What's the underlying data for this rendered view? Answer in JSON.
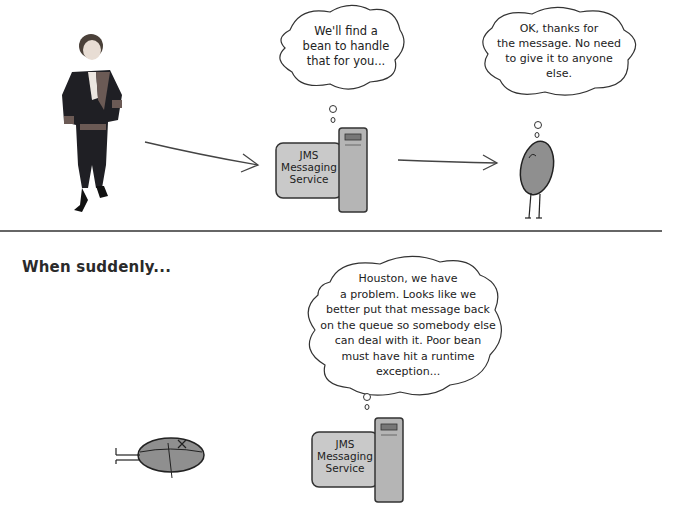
{
  "scene_top": {
    "person_bubble": null,
    "jms_bubble": {
      "lines": [
        "We'll find a",
        "bean to handle",
        "that for you..."
      ]
    },
    "bean_bubble": {
      "lines": [
        "OK, thanks for",
        "the message. No need",
        "to give it to anyone",
        "else."
      ]
    },
    "jms_box": {
      "lines": [
        "JMS",
        "Messaging",
        "Service"
      ]
    }
  },
  "divider": {
    "color": "#333333"
  },
  "scene_bottom": {
    "heading": "When suddenly...",
    "jms_bubble": {
      "lines": [
        "Houston, we have",
        "a problem. Looks like we",
        "better put that message back",
        "on the queue so somebody else",
        "can deal with it. Poor bean",
        "must have hit a runtime",
        "exception..."
      ]
    },
    "jms_box": {
      "lines": [
        "JMS",
        "Messaging",
        "Service"
      ]
    }
  },
  "colors": {
    "ink": "#222222",
    "box_fill": "#c9c9c9",
    "tower_fill": "#b5b5b5",
    "bean_fill": "#8f8f8f",
    "coat": "#1f1f24"
  }
}
